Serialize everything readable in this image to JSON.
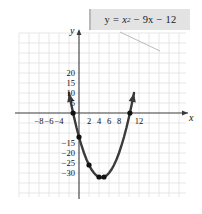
{
  "figure": {
    "equation_label": {
      "full_text": "y = x² − 9x − 12",
      "lhs": "y",
      "equals": "=",
      "term1_base": "x",
      "term1_exp": "2",
      "term2": "− 9x",
      "term3": "− 12",
      "box_color": "#e3e3e3",
      "box_edge_color": "#b9b9b9"
    },
    "axes": {
      "x_name": "x",
      "y_name": "y",
      "axis_color": "#333333",
      "grid_color": "#d9d9d9"
    },
    "x_tick_labels": [
      "−8",
      "−6",
      "−4",
      "2",
      "4",
      "6",
      "8",
      "12"
    ],
    "y_tick_labels": [
      "20",
      "15",
      "10",
      "5",
      "−15",
      "−20",
      "−25",
      "−30"
    ]
  },
  "chart_data": {
    "type": "line",
    "title": "",
    "subtitle": "",
    "xlabel": "x",
    "ylabel": "y",
    "equation": "y = x^2 - 9x - 12",
    "curve_color": "#3a3a3a",
    "point_color": "#111111",
    "grid": true,
    "legend": "none",
    "xlim": [
      -9,
      14
    ],
    "ylim": [
      -35,
      24
    ],
    "x_ticks": [
      -8,
      -6,
      -4,
      2,
      4,
      6,
      8,
      12
    ],
    "y_ticks": [
      20,
      15,
      10,
      5,
      -15,
      -20,
      -25,
      -30
    ],
    "x_tick_step": 2,
    "y_tick_step": 5,
    "grid_cell_x_units": 2,
    "grid_cell_y_units": 5,
    "vertex": [
      4.5,
      -32.25
    ],
    "roots": [
      -1.18,
      10.18
    ],
    "y_intercept": -12,
    "marked_points": [
      {
        "x": -1.18,
        "y": 0
      },
      {
        "x": 0,
        "y": -12
      },
      {
        "x": 2,
        "y": -26
      },
      {
        "x": 4,
        "y": -32
      },
      {
        "x": 5,
        "y": -32
      },
      {
        "x": 10.18,
        "y": 0
      }
    ],
    "series": [
      {
        "name": "y = x^2 - 9x - 12",
        "x": [
          -2.0,
          -1.5,
          -1.0,
          -0.5,
          0.0,
          0.5,
          1.0,
          1.5,
          2.0,
          2.5,
          3.0,
          3.5,
          4.0,
          4.5,
          5.0,
          5.5,
          6.0,
          6.5,
          7.0,
          7.5,
          8.0,
          8.5,
          9.0,
          9.5,
          10.0,
          10.5,
          11.0
        ],
        "values": [
          10.0,
          3.75,
          -2.0,
          -7.25,
          -12.0,
          -16.25,
          -20.0,
          -23.25,
          -26.0,
          -28.25,
          -30.0,
          -31.25,
          -32.0,
          -32.25,
          -32.0,
          -31.25,
          -30.0,
          -28.25,
          -26.0,
          -23.25,
          -20.0,
          -16.25,
          -12.0,
          -7.25,
          -2.0,
          3.75,
          10.0
        ]
      }
    ]
  }
}
